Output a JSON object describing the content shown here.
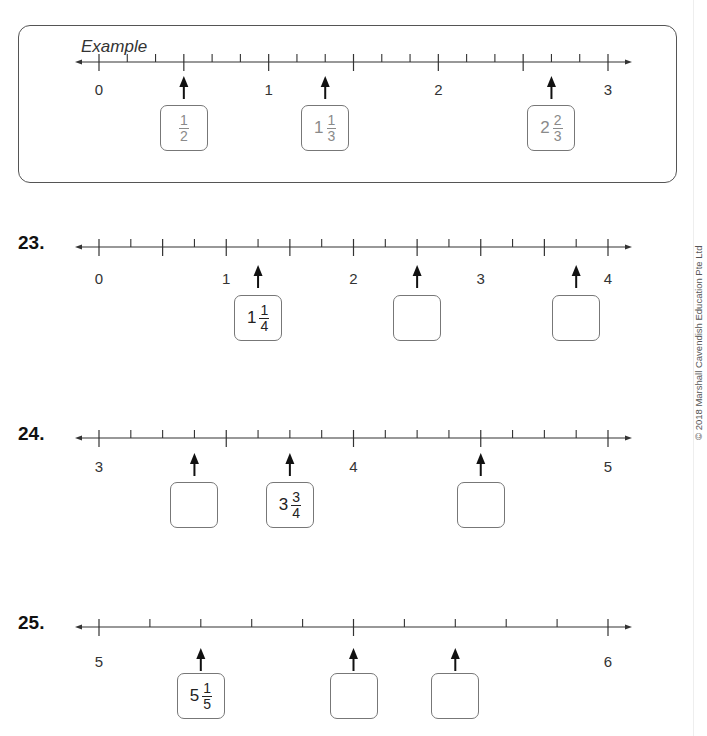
{
  "example": {
    "label": "Example",
    "line": {
      "start": 0,
      "end": 3,
      "divisions_per_unit": 6,
      "long_tick_every": 0.5,
      "labels": [
        "0",
        "1",
        "2",
        "3"
      ]
    },
    "answers": [
      {
        "position": 0.5,
        "whole": "",
        "num": "1",
        "den": "2"
      },
      {
        "position": 1.3333,
        "whole": "1",
        "num": "1",
        "den": "3"
      },
      {
        "position": 2.6667,
        "whole": "2",
        "num": "2",
        "den": "3"
      }
    ]
  },
  "questions": [
    {
      "number": "23.",
      "line": {
        "start": 0,
        "end": 4,
        "divisions_per_unit": 4,
        "long_tick_every": 0.5,
        "labels": [
          "0",
          "1",
          "2",
          "3",
          "4"
        ]
      },
      "answers": [
        {
          "position": 1.25,
          "whole": "1",
          "num": "1",
          "den": "4"
        },
        {
          "position": 2.5,
          "whole": "",
          "num": "",
          "den": ""
        },
        {
          "position": 3.75,
          "whole": "",
          "num": "",
          "den": ""
        }
      ]
    },
    {
      "number": "24.",
      "line": {
        "start": 3,
        "end": 5,
        "divisions_per_unit": 8,
        "long_tick_every": 0.5,
        "labels": [
          "3",
          "4",
          "5"
        ]
      },
      "answers": [
        {
          "position": 3.375,
          "whole": "",
          "num": "",
          "den": ""
        },
        {
          "position": 3.75,
          "whole": "3",
          "num": "3",
          "den": "4"
        },
        {
          "position": 4.5,
          "whole": "",
          "num": "",
          "den": ""
        }
      ]
    },
    {
      "number": "25.",
      "line": {
        "start": 5,
        "end": 6,
        "divisions_per_unit": 10,
        "long_tick_every": 0.5,
        "labels": [
          "5",
          "6"
        ]
      },
      "answers": [
        {
          "position": 5.2,
          "whole": "5",
          "num": "1",
          "den": "5"
        },
        {
          "position": 5.5,
          "whole": "",
          "num": "",
          "den": ""
        },
        {
          "position": 5.7,
          "whole": "",
          "num": "",
          "den": ""
        }
      ]
    }
  ],
  "footer": {
    "copyright": "© 2018 Marshall Cavendish Education Pte Ltd"
  }
}
